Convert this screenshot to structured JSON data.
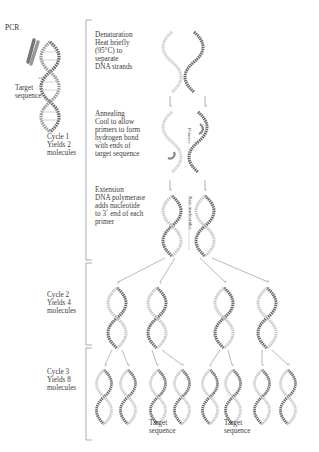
{
  "figure": {
    "title": "PCR",
    "target_label": "Target\nsequence",
    "steps": [
      {
        "name": "Denaturation",
        "text": "Denaturation\nHeat briefly\n(95°C) to\nseparate\nDNA strands"
      },
      {
        "name": "Annealing",
        "text": "Annealing\nCool to allow\nprimers to form\nhydrogen bond\nwith ends of\ntarget sequence"
      },
      {
        "name": "Extension",
        "text": "Extension\nDNA polymerase\nadds nucleotide\nto 3´ end of each\nprimer"
      }
    ],
    "cycles": [
      {
        "label": "Cycle 1\nYields 2\nmolecules"
      },
      {
        "label": "Cycle 2\nYields 4\nmolecules"
      },
      {
        "label": "Cycle 3\nYields 8\nmolecules"
      }
    ],
    "annotations": {
      "primers": "Primers",
      "new_nucleotides": "New nucleotides",
      "bottom_target_1": "Target\nsequence",
      "bottom_target_2": "Target\nsequence"
    },
    "colors": {
      "dark_strand": "#6a6a6a",
      "light_strand": "#c8c8c8",
      "bracket": "#9a9a9a",
      "arrow": "#8a8a8a"
    }
  }
}
